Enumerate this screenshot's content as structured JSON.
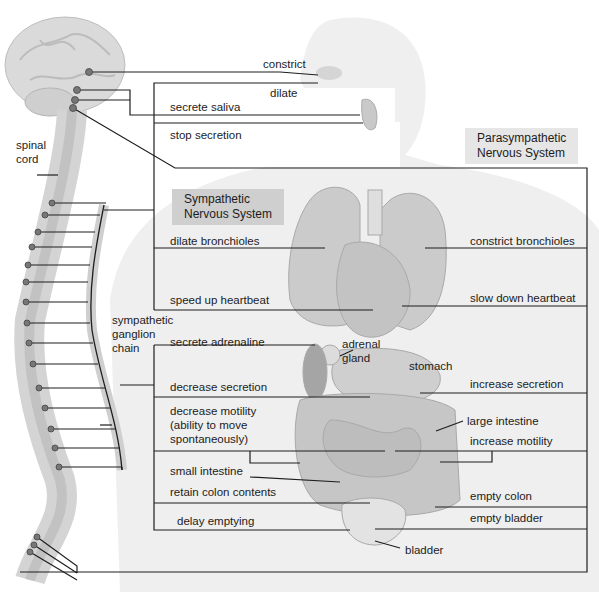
{
  "diagram": {
    "title_fragment": "",
    "systems": {
      "sympathetic": "Sympathetic\nNervous System",
      "parasympathetic": "Parasympathetic\nNervous System"
    },
    "anatomy_labels": {
      "spinal_cord": "spinal\ncord",
      "ganglion_chain": "sympathetic\nganglion\nchain",
      "adrenal_gland": "adrenal\ngland",
      "stomach": "stomach",
      "large_intestine": "large intestine",
      "small_intestine": "small intestine",
      "bladder": "bladder"
    },
    "sympathetic_effects": [
      {
        "organ": "eye",
        "effect": "dilate"
      },
      {
        "organ": "salivary gland",
        "effect": "stop secretion"
      },
      {
        "organ": "lungs",
        "effect": "dilate bronchioles"
      },
      {
        "organ": "heart",
        "effect": "speed up heartbeat"
      },
      {
        "organ": "adrenal gland",
        "effect": "secrete adrenaline"
      },
      {
        "organ": "stomach",
        "effect": "decrease secretion"
      },
      {
        "organ": "intestine",
        "effect": "decrease motility\n(ability to move\nspontaneously)"
      },
      {
        "organ": "colon",
        "effect": "retain colon contents"
      },
      {
        "organ": "bladder",
        "effect": "delay emptying"
      }
    ],
    "parasympathetic_effects": [
      {
        "organ": "eye",
        "effect": "constrict"
      },
      {
        "organ": "salivary gland",
        "effect": "secrete saliva"
      },
      {
        "organ": "lungs",
        "effect": "constrict bronchioles"
      },
      {
        "organ": "heart",
        "effect": "slow down heartbeat"
      },
      {
        "organ": "stomach",
        "effect": "increase secretion"
      },
      {
        "organ": "intestine",
        "effect": "increase motility"
      },
      {
        "organ": "colon",
        "effect": "empty colon"
      },
      {
        "organ": "bladder",
        "effect": "empty bladder"
      }
    ],
    "colors": {
      "line": "#1e1e1e",
      "node": "#6e6e6e",
      "sympathetic_box": "#cfcfcf",
      "parasympathetic_box": "#e6e6e6",
      "body_fill": "#ececec",
      "organ_fill": "#c8c8c8"
    }
  }
}
